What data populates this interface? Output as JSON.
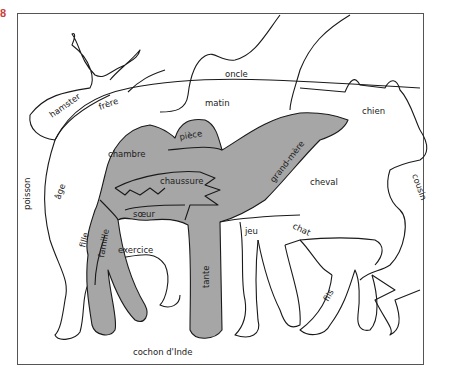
{
  "exercise_number": "8",
  "colors": {
    "camel_fill": "#a6a6a6",
    "outline": "#1a1a1a",
    "frame": "#555555",
    "exercise_number": "#c8403a"
  },
  "words": {
    "oncle": "oncle",
    "hamster": "hamster",
    "frere": "frère",
    "matin": "matin",
    "chien": "chien",
    "poisson": "poisson",
    "chambre": "chambre",
    "piece": "pièce",
    "chaussure": "chaussure",
    "grand_mere": "grand-mère",
    "age": "âge",
    "cheval": "cheval",
    "cousin": "cousin",
    "soeur": "sœur",
    "jeu": "jeu",
    "chat": "chat",
    "fille": "fille",
    "famille": "famille",
    "exercice": "exercice",
    "tante": "tante",
    "fils": "fils",
    "cochon_dinde": "cochon d'Inde"
  },
  "shaded_words": [
    "chambre",
    "pièce",
    "chaussure",
    "grand-mère",
    "sœur",
    "fille",
    "famille",
    "tante"
  ]
}
